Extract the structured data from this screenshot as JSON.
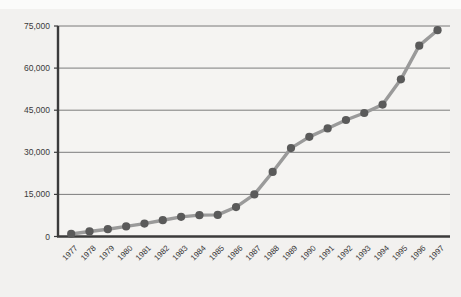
{
  "chart_data": {
    "type": "line",
    "title": "",
    "subtitle": "",
    "xlabel": "",
    "ylabel": "",
    "categories": [
      "1977",
      "1978",
      "1979",
      "1980",
      "1981",
      "1982",
      "1983",
      "1984",
      "1985",
      "1986",
      "1987",
      "1988",
      "1989",
      "1990",
      "1991",
      "1992",
      "1993",
      "1994",
      "1995",
      "1996",
      "1997"
    ],
    "values": [
      900,
      1800,
      2600,
      3600,
      4600,
      5800,
      7000,
      7600,
      7700,
      10500,
      15000,
      23000,
      31500,
      35500,
      38500,
      41500,
      44000,
      47000,
      56000,
      68000,
      73500
    ],
    "series": [
      {
        "name": "Series 1",
        "values": [
          900,
          1800,
          2600,
          3600,
          4600,
          5800,
          7000,
          7600,
          7700,
          10500,
          15000,
          23000,
          31500,
          35500,
          38500,
          41500,
          44000,
          47000,
          56000,
          68000,
          73500
        ]
      }
    ],
    "ytick_labels": [
      "0",
      "15,000",
      "30,000",
      "45,000",
      "60,000",
      "75,000"
    ],
    "ytick_values": [
      0,
      15000,
      30000,
      45000,
      60000,
      75000
    ],
    "ylim": [
      0,
      75000
    ],
    "grid": "horizontal",
    "legend": "none",
    "marker": "circle",
    "colors": {
      "marker": "#5a5a5a",
      "line": "#9a9a9a",
      "axis": "#3b3b3b",
      "gridline": "#6e6e6e",
      "background": "#f2f1ef",
      "plot_background": "#f5f4f2",
      "label_text": "#3a3a3a"
    }
  }
}
